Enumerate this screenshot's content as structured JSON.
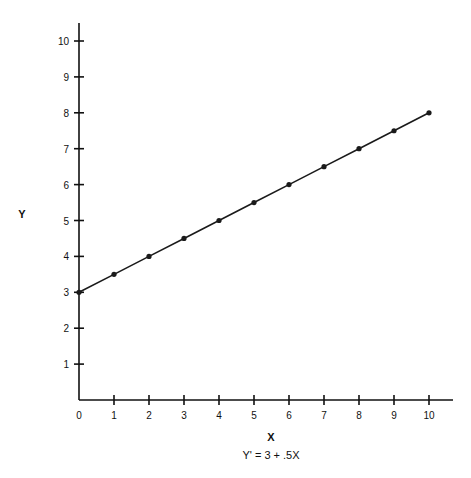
{
  "chart_data": {
    "type": "line",
    "title": "",
    "xlabel": "X",
    "ylabel": "Y",
    "caption": "Y' = 3 + .5X",
    "x": [
      0,
      1,
      2,
      3,
      4,
      5,
      6,
      7,
      8,
      9,
      10
    ],
    "series": [
      {
        "name": "Y' = 3 + .5X",
        "values": [
          3,
          3.5,
          4,
          4.5,
          5,
          5.5,
          6,
          6.5,
          7,
          7.5,
          8
        ],
        "markers": true
      }
    ],
    "xlim": [
      0,
      10
    ],
    "ylim": [
      0,
      10
    ],
    "x_ticks": [
      "0",
      "1",
      "2",
      "3",
      "4",
      "5",
      "6",
      "7",
      "8",
      "9",
      "10"
    ],
    "y_ticks": [
      "1",
      "2",
      "3",
      "4",
      "5",
      "6",
      "7",
      "8",
      "9",
      "10"
    ],
    "grid": false,
    "legend": "none",
    "line_color": "#1a1a1a"
  }
}
